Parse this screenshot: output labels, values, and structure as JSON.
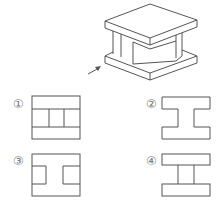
{
  "figure": {
    "view_arrow": "arrow-pointing-up-right"
  },
  "options": [
    {
      "label": "①",
      "shape": "rectangle with two horizontal lines and two inner vertical lines"
    },
    {
      "label": "②",
      "shape": "I-shape outline"
    },
    {
      "label": "③",
      "shape": "rectangle with two side rectangular notches"
    },
    {
      "label": "④",
      "shape": "two separated horizontal slabs connected by vertical web"
    }
  ],
  "colors": {
    "line": "#555555",
    "label": "#777777",
    "background": "#ffffff"
  }
}
